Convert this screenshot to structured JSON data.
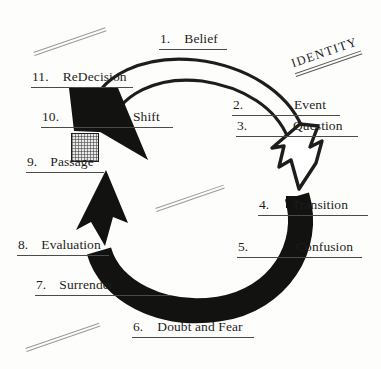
{
  "diagram": {
    "identity_label": "IDENTITY",
    "center_label": "",
    "colors": {
      "ink": "#1d1d1b",
      "paper": "#fdfdfc",
      "rule": "#4a4a46",
      "deco_line": "#9a9a96",
      "hatch_fill": "#e8e8e8"
    },
    "steps": [
      {
        "num": "1.",
        "label": "Belief"
      },
      {
        "num": "2.",
        "label": "Event"
      },
      {
        "num": "3.",
        "label": "Question"
      },
      {
        "num": "4.",
        "label": "Transition"
      },
      {
        "num": "5.",
        "label": "Confusion"
      },
      {
        "num": "6.",
        "label": "Doubt and Fear"
      },
      {
        "num": "7.",
        "label": "Surrender"
      },
      {
        "num": "8.",
        "label": "Evaluation"
      },
      {
        "num": "9.",
        "label": "Passage"
      },
      {
        "num": "10.",
        "label": "Shift"
      },
      {
        "num": "11.",
        "label": "ReDecision"
      }
    ],
    "arrows": [
      {
        "name": "outer-thin-arc",
        "style": "thin-outline",
        "direction": "clockwise"
      },
      {
        "name": "inner-thin-arc",
        "style": "thin-outline",
        "direction": "clockwise"
      },
      {
        "name": "open-arrowhead",
        "style": "outline",
        "points_to": "4. Transition"
      },
      {
        "name": "thick-black-arc",
        "style": "solid-black",
        "direction": "counter-clockwise"
      },
      {
        "name": "black-arrowhead-up",
        "style": "solid-black",
        "points_to": "9. Passage"
      },
      {
        "name": "black-arrowhead-shift",
        "style": "solid-black",
        "points_to": "10. Shift"
      }
    ],
    "decorations": [
      {
        "name": "deco-line-top-left"
      },
      {
        "name": "deco-line-center"
      },
      {
        "name": "deco-line-bottom-left"
      },
      {
        "name": "hatched-box"
      }
    ]
  }
}
